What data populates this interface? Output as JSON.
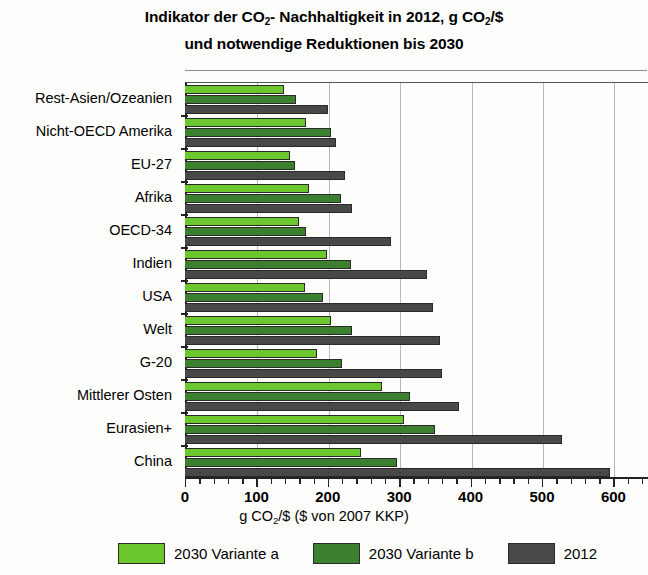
{
  "chart_data": {
    "type": "bar",
    "orientation": "horizontal",
    "title": "Indikator der CO2- Nachhaltigkeit in 2012,  g CO2/$",
    "title_lines": [
      "Indikator der CO2- Nachhaltigkeit in 2012,  g CO2/$",
      "und notwendige Reduktionen bis 2030"
    ],
    "xlabel": "g CO2/$  ($ von 2007 KKP)",
    "ylabel": "",
    "xlim": [
      0,
      648
    ],
    "xticks": [
      0,
      100,
      200,
      300,
      400,
      500,
      600
    ],
    "xtick_labels": [
      "0",
      "100",
      "200",
      "300",
      "400",
      "500",
      "600"
    ],
    "minor_tick_step": 20,
    "grid": "vertical",
    "legend_position": "bottom",
    "categories": [
      "Rest-Asien/Ozeanien",
      "Nicht-OECD Amerika",
      "EU-27",
      "Afrika",
      "OECD-34",
      "Indien",
      "USA",
      "Welt",
      "G-20",
      "Mittlerer Osten",
      "Eurasien+",
      "China"
    ],
    "series": [
      {
        "name": "2030 Variante a",
        "color": "#6CC62E",
        "values": [
          139,
          170,
          147,
          173,
          159,
          199,
          168,
          204,
          185,
          276,
          307,
          246
        ]
      },
      {
        "name": "2030 Variante b",
        "color": "#3C7F2E",
        "values": [
          155,
          205,
          154,
          219,
          170,
          232,
          193,
          234,
          220,
          315,
          350,
          297
        ]
      },
      {
        "name": "2012",
        "color": "#484848",
        "values": [
          200,
          212,
          224,
          234,
          289,
          339,
          347,
          357,
          360,
          384,
          528,
          595
        ]
      }
    ]
  },
  "legend": {
    "items": [
      {
        "label": "2030 Variante a",
        "color": "#6CC62E"
      },
      {
        "label": "2030 Variante b",
        "color": "#3C7F2E"
      },
      {
        "label": "2012",
        "color": "#484848"
      }
    ]
  },
  "axis": {
    "x_title_main": "g CO",
    "x_title_sub": "2",
    "x_title_rest": "/$  ($ von 2007 KKP)"
  },
  "title": {
    "line1_a": "Indikator der CO",
    "line1_sub1": "2",
    "line1_b": "- Nachhaltigkeit in 2012,  g CO",
    "line1_sub2": "2",
    "line1_c": "/$",
    "line2": "und notwendige Reduktionen bis 2030"
  }
}
